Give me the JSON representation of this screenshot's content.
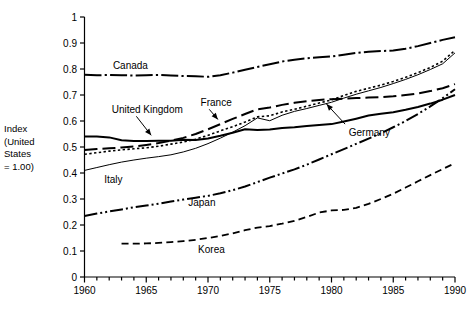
{
  "chart_data": {
    "type": "line",
    "title": "",
    "xlabel": "",
    "ylabel": "Index (United States = 1.00)",
    "ylabel_lines": [
      "Index",
      "(United",
      "States",
      "= 1.00)"
    ],
    "xlim": [
      1960,
      1990
    ],
    "ylim": [
      0,
      1
    ],
    "grid": false,
    "legend_position": "inline-annotations",
    "ytick_labels": [
      "0",
      "0.1",
      "0.2",
      "0.3",
      "0.4",
      "0.5",
      "0.6",
      "0.7",
      "0.8",
      "0.9",
      "1"
    ],
    "ytick_values": [
      0,
      0.1,
      0.2,
      0.3,
      0.4,
      0.5,
      0.6,
      0.7,
      0.8,
      0.9,
      1
    ],
    "xtick_labels": [
      "1960",
      "1965",
      "1970",
      "1975",
      "1980",
      "1985",
      "1990"
    ],
    "xtick_values": [
      1960,
      1965,
      1970,
      1975,
      1980,
      1985,
      1990
    ],
    "xtick_minor_step": 1,
    "series": [
      {
        "name": "Canada",
        "line_style": "dash-dot",
        "line_width": 2.0,
        "color": "#000000",
        "label_x": 1962.3,
        "label_y": 0.815,
        "x": [
          1960,
          1961,
          1962,
          1963,
          1964,
          1965,
          1966,
          1967,
          1968,
          1969,
          1970,
          1971,
          1972,
          1973,
          1974,
          1975,
          1976,
          1977,
          1978,
          1979,
          1980,
          1981,
          1982,
          1983,
          1984,
          1985,
          1986,
          1987,
          1988,
          1989,
          1990
        ],
        "values": [
          0.778,
          0.776,
          0.777,
          0.776,
          0.775,
          0.776,
          0.777,
          0.775,
          0.773,
          0.772,
          0.77,
          0.776,
          0.786,
          0.797,
          0.808,
          0.818,
          0.829,
          0.836,
          0.841,
          0.845,
          0.848,
          0.855,
          0.862,
          0.866,
          0.869,
          0.871,
          0.878,
          0.888,
          0.9,
          0.912,
          0.922
        ]
      },
      {
        "name": "France",
        "line_style": "dotted",
        "line_width": 1.6,
        "color": "#000000",
        "label_x": 1969.4,
        "label_y": 0.672,
        "arrow_from_x": 1970.1,
        "arrow_from_y": 0.645,
        "arrow_to_x": 1970.8,
        "arrow_to_y": 0.606,
        "x": [
          1960,
          1961,
          1962,
          1963,
          1964,
          1965,
          1966,
          1967,
          1968,
          1969,
          1970,
          1971,
          1972,
          1973,
          1974,
          1975,
          1976,
          1977,
          1978,
          1979,
          1980,
          1981,
          1982,
          1983,
          1984,
          1985,
          1986,
          1987,
          1988,
          1989,
          1990
        ],
        "values": [
          0.472,
          0.478,
          0.484,
          0.489,
          0.493,
          0.497,
          0.503,
          0.511,
          0.519,
          0.53,
          0.545,
          0.562,
          0.578,
          0.596,
          0.616,
          0.62,
          0.635,
          0.645,
          0.657,
          0.669,
          0.681,
          0.698,
          0.714,
          0.726,
          0.738,
          0.752,
          0.768,
          0.786,
          0.806,
          0.83,
          0.872
        ]
      },
      {
        "name": "Italy",
        "line_style": "thin-solid",
        "line_width": 1.0,
        "color": "#000000",
        "label_x": 1961.6,
        "label_y": 0.375,
        "x": [
          1960,
          1961,
          1962,
          1963,
          1964,
          1965,
          1966,
          1967,
          1968,
          1969,
          1970,
          1971,
          1972,
          1973,
          1974,
          1975,
          1976,
          1977,
          1978,
          1979,
          1980,
          1981,
          1982,
          1983,
          1984,
          1985,
          1986,
          1987,
          1988,
          1989,
          1990
        ],
        "values": [
          0.41,
          0.421,
          0.432,
          0.442,
          0.45,
          0.457,
          0.463,
          0.47,
          0.481,
          0.495,
          0.513,
          0.534,
          0.557,
          0.582,
          0.612,
          0.601,
          0.622,
          0.637,
          0.648,
          0.66,
          0.672,
          0.688,
          0.703,
          0.716,
          0.729,
          0.744,
          0.76,
          0.778,
          0.798,
          0.82,
          0.862
        ]
      },
      {
        "name": "United Kingdom",
        "line_style": "solid",
        "line_width": 2.0,
        "color": "#000000",
        "label_x": 1962.2,
        "label_y": 0.645,
        "arrow_from_x": 1964.2,
        "arrow_from_y": 0.618,
        "arrow_to_x": 1965.4,
        "arrow_to_y": 0.545,
        "x": [
          1960,
          1961,
          1962,
          1963,
          1964,
          1965,
          1966,
          1967,
          1968,
          1969,
          1970,
          1971,
          1972,
          1973,
          1974,
          1975,
          1976,
          1977,
          1978,
          1979,
          1980,
          1981,
          1982,
          1983,
          1984,
          1985,
          1986,
          1987,
          1988,
          1989,
          1990
        ],
        "values": [
          0.54,
          0.54,
          0.537,
          0.526,
          0.523,
          0.523,
          0.524,
          0.524,
          0.528,
          0.527,
          0.533,
          0.543,
          0.555,
          0.568,
          0.565,
          0.567,
          0.573,
          0.576,
          0.581,
          0.585,
          0.588,
          0.598,
          0.609,
          0.621,
          0.628,
          0.634,
          0.643,
          0.654,
          0.667,
          0.682,
          0.7
        ]
      },
      {
        "name": "Germany",
        "line_style": "long-dash",
        "line_width": 2.0,
        "color": "#000000",
        "label_x": 1981.4,
        "label_y": 0.555,
        "arrow_from_x": 1981.1,
        "arrow_from_y": 0.588,
        "arrow_to_x": 1979.6,
        "arrow_to_y": 0.665,
        "x": [
          1960,
          1961,
          1962,
          1963,
          1964,
          1965,
          1966,
          1967,
          1968,
          1969,
          1970,
          1971,
          1972,
          1973,
          1974,
          1975,
          1976,
          1977,
          1978,
          1979,
          1980,
          1981,
          1982,
          1983,
          1984,
          1985,
          1986,
          1987,
          1988,
          1989,
          1990
        ],
        "values": [
          0.488,
          0.492,
          0.495,
          0.498,
          0.502,
          0.508,
          0.515,
          0.524,
          0.535,
          0.55,
          0.568,
          0.588,
          0.608,
          0.627,
          0.645,
          0.652,
          0.662,
          0.67,
          0.676,
          0.681,
          0.684,
          0.686,
          0.688,
          0.69,
          0.692,
          0.695,
          0.7,
          0.706,
          0.715,
          0.726,
          0.742
        ]
      },
      {
        "name": "Japan",
        "line_style": "dash-dot-dot",
        "line_width": 2.0,
        "color": "#000000",
        "label_x": 1968.4,
        "label_y": 0.288,
        "x": [
          1960,
          1961,
          1962,
          1963,
          1964,
          1965,
          1966,
          1967,
          1968,
          1969,
          1970,
          1971,
          1972,
          1973,
          1974,
          1975,
          1976,
          1977,
          1978,
          1979,
          1980,
          1981,
          1982,
          1983,
          1984,
          1985,
          1986,
          1987,
          1988,
          1989,
          1990
        ],
        "values": [
          0.235,
          0.244,
          0.252,
          0.26,
          0.268,
          0.275,
          0.282,
          0.29,
          0.298,
          0.305,
          0.312,
          0.322,
          0.334,
          0.348,
          0.365,
          0.382,
          0.398,
          0.414,
          0.432,
          0.452,
          0.472,
          0.492,
          0.512,
          0.532,
          0.553,
          0.576,
          0.6,
          0.627,
          0.656,
          0.688,
          0.722
        ]
      },
      {
        "name": "Korea",
        "line_style": "dash",
        "line_width": 1.8,
        "color": "#000000",
        "label_x": 1969.2,
        "label_y": 0.105,
        "x": [
          1963,
          1964,
          1965,
          1966,
          1967,
          1968,
          1969,
          1970,
          1971,
          1972,
          1973,
          1974,
          1975,
          1976,
          1977,
          1978,
          1979,
          1980,
          1981,
          1982,
          1983,
          1984,
          1985,
          1986,
          1987,
          1988,
          1989,
          1990
        ],
        "values": [
          0.128,
          0.128,
          0.129,
          0.131,
          0.134,
          0.138,
          0.143,
          0.15,
          0.158,
          0.168,
          0.18,
          0.19,
          0.196,
          0.205,
          0.216,
          0.231,
          0.248,
          0.256,
          0.258,
          0.266,
          0.281,
          0.3,
          0.32,
          0.344,
          0.368,
          0.392,
          0.415,
          0.438
        ]
      }
    ]
  }
}
